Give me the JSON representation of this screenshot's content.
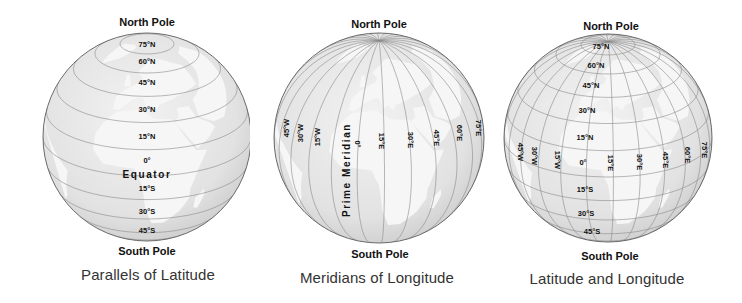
{
  "globes": [
    {
      "id": "parallels",
      "north_label": "North Pole",
      "south_label": "South Pole",
      "caption": "Parallels of Latitude",
      "latitude_labels": [
        "75°N",
        "60°N",
        "45°N",
        "30°N",
        "15°N",
        "0°",
        "15°S",
        "30°S",
        "45°S"
      ],
      "equator_label": "Equator"
    },
    {
      "id": "meridians",
      "north_label": "North Pole",
      "south_label": "South Pole",
      "caption": "Meridians of Longitude",
      "longitude_labels": [
        "45°W",
        "30°W",
        "15°W",
        "0°",
        "15°E",
        "30°E",
        "45°E",
        "60°E",
        "75°E"
      ],
      "prime_meridian_label": "Prime Meridian"
    },
    {
      "id": "grid",
      "north_label": "North Pole",
      "south_label": "South Pole",
      "caption": "Latitude and Longitude",
      "latitude_labels": [
        "75°N",
        "60°N",
        "45°N",
        "30°N",
        "15°N",
        "15°S",
        "30°S",
        "45°S"
      ],
      "longitude_labels": [
        "45°W",
        "30°W",
        "15°W",
        "0°",
        "15°E",
        "30°E",
        "45°E",
        "60°E",
        "75°E"
      ]
    }
  ],
  "colors": {
    "ocean": "#e4e4e4",
    "land": "#f6f6f6",
    "grid_line": "#8a8a8a",
    "outline": "#6a6a6a",
    "text": "#111111",
    "caption": "#333333"
  }
}
